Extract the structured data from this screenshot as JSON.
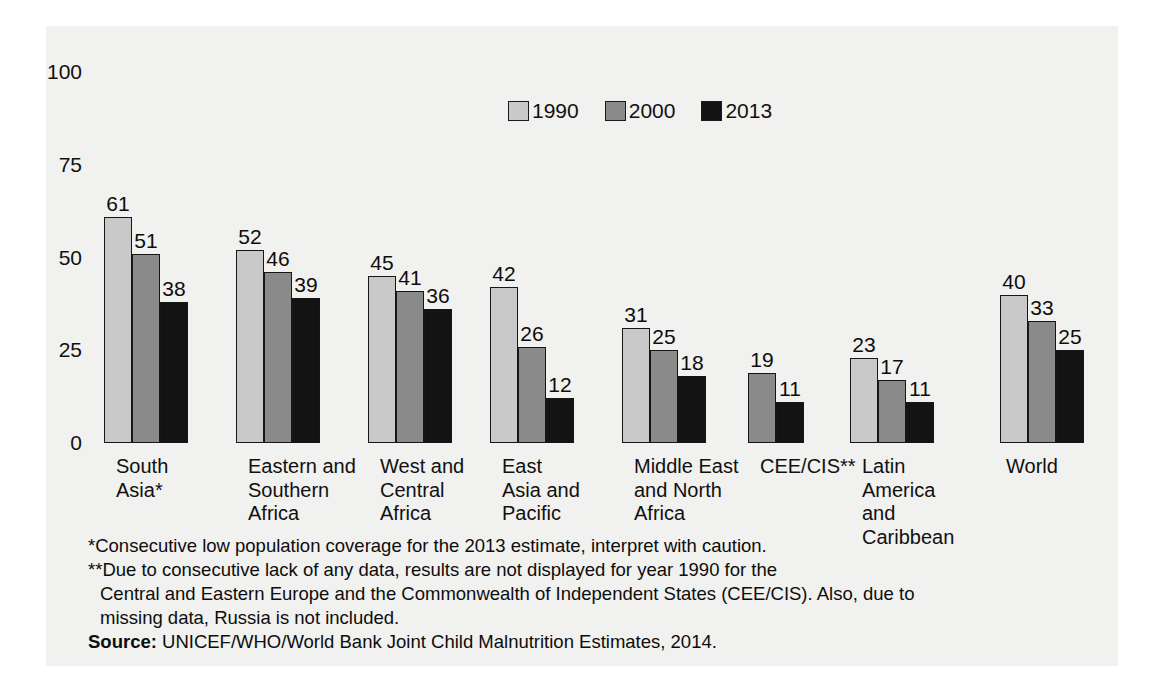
{
  "chart_data": {
    "type": "bar",
    "title": "",
    "subtitle": "",
    "xlabel": "",
    "ylabel": "",
    "ylim": [
      0,
      100
    ],
    "yticks": [
      "0",
      "25",
      "50",
      "75",
      "100"
    ],
    "grid": false,
    "legend_position": "top-center",
    "categories": [
      "South\nAsia*",
      "Eastern and\nSouthern\nAfrica",
      "West and\nCentral\nAfrica",
      "East\nAsia and\nPacific",
      "Middle East\nand North\nAfrica",
      "CEE/CIS**",
      "Latin\nAmerica\nand\nCaribbean",
      "World"
    ],
    "series": [
      {
        "name": "1990",
        "color": "#c9c9c9",
        "values": [
          61,
          52,
          45,
          42,
          31,
          null,
          23,
          40
        ]
      },
      {
        "name": "2000",
        "color": "#8a8a8a",
        "values": [
          51,
          46,
          41,
          26,
          25,
          19,
          17,
          33
        ]
      },
      {
        "name": "2013",
        "color": "#131313",
        "values": [
          38,
          39,
          36,
          12,
          18,
          11,
          11,
          25
        ]
      }
    ]
  },
  "legend": {
    "items": [
      {
        "label": "1990",
        "color": "#c9c9c9"
      },
      {
        "label": "2000",
        "color": "#8a8a8a"
      },
      {
        "label": "2013",
        "color": "#131313"
      }
    ]
  },
  "notes": {
    "footnote_1": "*Consecutive low population coverage for the 2013 estimate, interpret with caution.",
    "footnote_2_line1": "**Due to consecutive lack of any data, results are not displayed for year 1990 for the",
    "footnote_2_line2": "Central and Eastern Europe and the Commonwealth of Independent States (CEE/CIS). Also, due to",
    "footnote_2_line3": "missing data, Russia is not included.",
    "source_label": "Source:",
    "source_text": " UNICEF/WHO/World Bank Joint Child Malnutrition Estimates, 2014."
  }
}
